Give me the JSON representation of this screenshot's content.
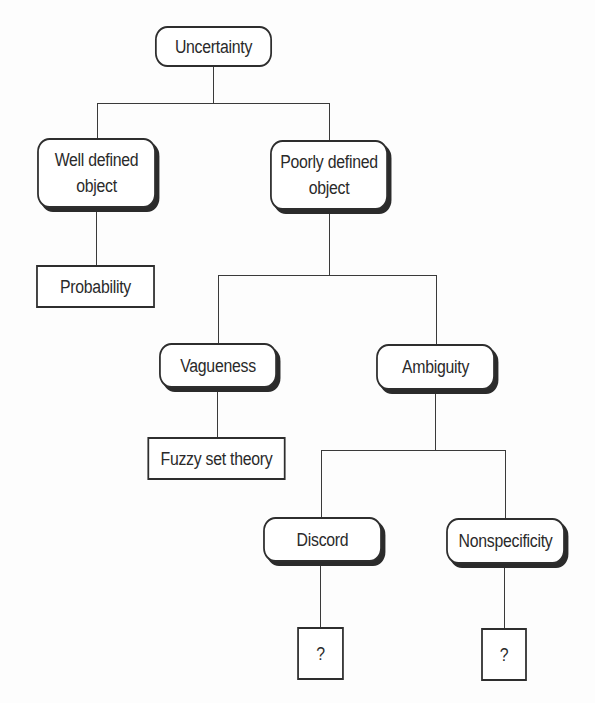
{
  "diagram": {
    "type": "tree",
    "nodes": {
      "root": {
        "label": "Uncertainty",
        "shape": "rounded"
      },
      "well_defined": {
        "label": "Well defined\nobject",
        "shape": "rounded-shadow"
      },
      "poorly_defined": {
        "label": "Poorly defined\nobject",
        "shape": "rounded-shadow"
      },
      "probability": {
        "label": "Probability",
        "shape": "rectangle"
      },
      "vagueness": {
        "label": "Vagueness",
        "shape": "rounded-shadow"
      },
      "ambiguity": {
        "label": "Ambiguity",
        "shape": "rounded-shadow"
      },
      "fuzzy": {
        "label": "Fuzzy set theory",
        "shape": "rectangle"
      },
      "discord": {
        "label": "Discord",
        "shape": "rounded-shadow"
      },
      "nonspecificity": {
        "label": "Nonspecificity",
        "shape": "rounded-shadow"
      },
      "discord_theory": {
        "label": "?",
        "shape": "rectangle"
      },
      "nonspecificity_theory": {
        "label": "?",
        "shape": "rectangle"
      }
    },
    "edges": [
      [
        "root",
        "well_defined"
      ],
      [
        "root",
        "poorly_defined"
      ],
      [
        "well_defined",
        "probability"
      ],
      [
        "poorly_defined",
        "vagueness"
      ],
      [
        "poorly_defined",
        "ambiguity"
      ],
      [
        "vagueness",
        "fuzzy"
      ],
      [
        "ambiguity",
        "discord"
      ],
      [
        "ambiguity",
        "nonspecificity"
      ],
      [
        "discord",
        "discord_theory"
      ],
      [
        "nonspecificity",
        "nonspecificity_theory"
      ]
    ],
    "colors": {
      "stroke": "#2e2e2e",
      "background": "#ffffff"
    }
  }
}
